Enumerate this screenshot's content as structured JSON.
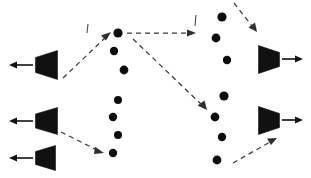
{
  "figure": {
    "title": "",
    "width": 311,
    "height": 178,
    "background_color": "#ffffff",
    "ink_color": "#111111",
    "dashed_edge_color": "#3a3a3a"
  },
  "chart_data": {
    "type": "diagram",
    "title": "",
    "xlabel": "",
    "ylabel": "",
    "legend": [],
    "annotations": [],
    "groups": [
      {
        "name": "left-ports",
        "label": "",
        "shape": "trapezoid-left",
        "count": 3,
        "nodes": [
          {
            "id": "L1",
            "label": "",
            "x": 46,
            "y": 65,
            "w": 22,
            "h": 28
          },
          {
            "id": "L2",
            "label": "",
            "x": 46,
            "y": 120,
            "w": 22,
            "h": 26
          },
          {
            "id": "L3",
            "label": "",
            "x": 44,
            "y": 157,
            "w": 20,
            "h": 24
          }
        ]
      },
      {
        "name": "middle-dots",
        "label": "",
        "shape": "dot",
        "count": 7,
        "nodes": [
          {
            "id": "M1",
            "label": "",
            "x": 118,
            "y": 33,
            "r": 4.6
          },
          {
            "id": "M2",
            "label": "",
            "x": 114,
            "y": 51,
            "r": 4.2
          },
          {
            "id": "M3",
            "label": "",
            "x": 124,
            "y": 70,
            "r": 4.4
          },
          {
            "id": "M4",
            "label": "",
            "x": 118,
            "y": 100,
            "r": 4.0
          },
          {
            "id": "M5",
            "label": "",
            "x": 113,
            "y": 117,
            "r": 4.2
          },
          {
            "id": "M6",
            "label": "",
            "x": 118,
            "y": 135,
            "r": 4.0
          },
          {
            "id": "M7",
            "label": "",
            "x": 113,
            "y": 153,
            "r": 4.2
          }
        ]
      },
      {
        "name": "right-dots",
        "label": "",
        "shape": "dot",
        "count": 7,
        "nodes": [
          {
            "id": "R1",
            "label": "",
            "x": 222,
            "y": 17,
            "r": 4.6
          },
          {
            "id": "R2",
            "label": "",
            "x": 216,
            "y": 38,
            "r": 4.4
          },
          {
            "id": "R3",
            "label": "",
            "x": 227,
            "y": 60,
            "r": 4.2
          },
          {
            "id": "R4",
            "label": "",
            "x": 224,
            "y": 96,
            "r": 4.6
          },
          {
            "id": "R5",
            "label": "",
            "x": 215,
            "y": 117,
            "r": 4.4
          },
          {
            "id": "R6",
            "label": "",
            "x": 222,
            "y": 137,
            "r": 4.2
          },
          {
            "id": "R7",
            "label": "",
            "x": 217,
            "y": 160,
            "r": 4.4
          }
        ]
      },
      {
        "name": "right-ports",
        "label": "",
        "shape": "trapezoid-right",
        "count": 2,
        "nodes": [
          {
            "id": "P1",
            "label": "",
            "x": 268,
            "y": 59,
            "w": 22,
            "h": 28
          },
          {
            "id": "P2",
            "label": "",
            "x": 268,
            "y": 120,
            "w": 22,
            "h": 28
          }
        ]
      }
    ],
    "edges": [
      {
        "id": "E1",
        "from": "L1",
        "to": "M1",
        "style": "dashed",
        "arrow": "end"
      },
      {
        "id": "E2",
        "from": "M1",
        "to": "right-boundary",
        "style": "dashed",
        "arrow": "end"
      },
      {
        "id": "E3",
        "from": "M1",
        "to": "R5",
        "style": "dashed",
        "arrow": "end"
      },
      {
        "id": "E4",
        "from": "L3",
        "to": "M7",
        "style": "dashed",
        "arrow": "end"
      },
      {
        "id": "E5",
        "from": "top-boundary",
        "to": "P1",
        "style": "dashed",
        "arrow": "end"
      },
      {
        "id": "E6",
        "from": "bottom-boundary",
        "to": "P2",
        "style": "dashed",
        "arrow": "end"
      },
      {
        "id": "E7",
        "from": "L1",
        "to": "left-out",
        "style": "solid",
        "arrow": "end"
      },
      {
        "id": "E8",
        "from": "L2",
        "to": "left-out",
        "style": "solid",
        "arrow": "end"
      },
      {
        "id": "E9",
        "from": "L3",
        "to": "left-out",
        "style": "solid",
        "arrow": "end"
      },
      {
        "id": "E10",
        "from": "P1",
        "to": "right-out",
        "style": "solid",
        "arrow": "end"
      },
      {
        "id": "E11",
        "from": "P2",
        "to": "right-out",
        "style": "solid",
        "arrow": "end"
      }
    ],
    "tick_marks": [
      {
        "id": "T1",
        "x": 88,
        "y": 33,
        "length": 9,
        "orientation": "vertical"
      },
      {
        "id": "T2",
        "x": 196,
        "y": 26,
        "length": 11,
        "orientation": "vertical"
      }
    ]
  }
}
